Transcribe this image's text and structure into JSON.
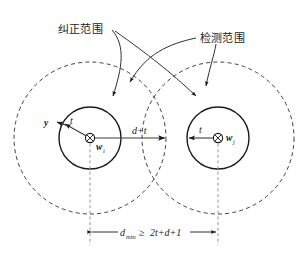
{
  "figure": {
    "type": "geometry-diagram"
  },
  "annotations": {
    "correction_range_label": "纠正范围",
    "detection_range_label": "检测范围"
  },
  "left_node": {
    "center_label": "w",
    "center_subscript": "i",
    "radius_label": "t",
    "edge_label": "y"
  },
  "right_node": {
    "center_label": "w",
    "center_subscript": "j",
    "radius_label": "t"
  },
  "middle": {
    "outer_radius_label": "d+t"
  },
  "dimension": {
    "symbol": "d",
    "subscript": "min",
    "relation": "≥",
    "expression": "2t+d+1",
    "full_text": "d_min ≥ 2t+d+1"
  },
  "geometry": {
    "left_center_x": 90,
    "left_center_y": 138,
    "right_center_x": 218,
    "right_center_y": 138,
    "inner_radius": 31,
    "outer_radius": 76,
    "dimension_line_y": 232
  },
  "colors": {
    "stroke": "#1a1a1a",
    "dashed_stroke": "#2b2b2b",
    "center_guide": "#8c8c8c",
    "background": "#ffffff"
  }
}
